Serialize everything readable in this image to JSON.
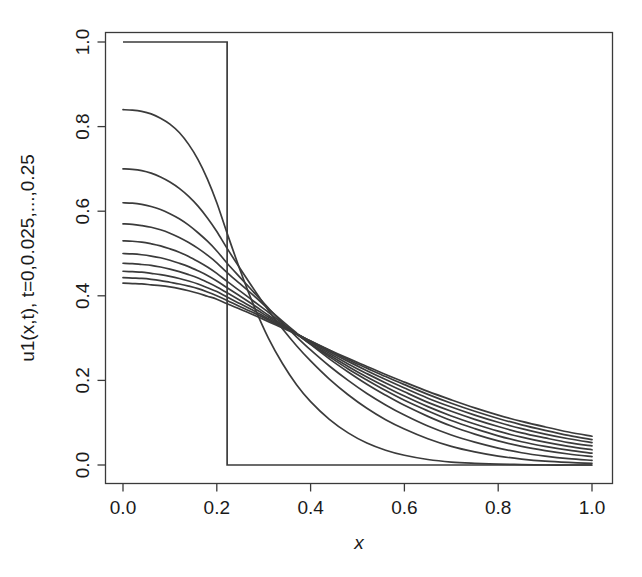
{
  "chart_data": {
    "type": "line",
    "title": "",
    "xlabel": "x",
    "ylabel": "u1(x,t), t=0,0.025,...,0.25",
    "xlim": [
      0.0,
      1.0
    ],
    "ylim": [
      0.0,
      1.0
    ],
    "grid": false,
    "legend": null,
    "x_ticks": [
      0.0,
      0.2,
      0.4,
      0.6,
      0.8,
      1.0
    ],
    "x_tick_labels": [
      "0.0",
      "0.2",
      "0.4",
      "0.6",
      "0.8",
      "1.0"
    ],
    "y_ticks": [
      0.0,
      0.2,
      0.4,
      0.6,
      0.8,
      1.0
    ],
    "y_tick_labels": [
      "0.0",
      "0.2",
      "0.4",
      "0.6",
      "0.8",
      "1.0"
    ],
    "step_location": 0.222,
    "x": [
      0.0,
      0.02,
      0.04,
      0.06,
      0.08,
      0.1,
      0.12,
      0.14,
      0.16,
      0.18,
      0.2,
      0.222,
      0.25,
      0.28,
      0.31,
      0.34,
      0.37,
      0.4,
      0.44,
      0.48,
      0.52,
      0.56,
      0.6,
      0.65,
      0.7,
      0.75,
      0.8,
      0.85,
      0.9,
      0.95,
      1.0
    ],
    "series": [
      {
        "name": "t=0",
        "t": 0,
        "values": [
          1.0,
          1.0,
          1.0,
          1.0,
          1.0,
          1.0,
          1.0,
          1.0,
          1.0,
          1.0,
          1.0,
          1.0,
          0.0,
          0.0,
          0.0,
          0.0,
          0.0,
          0.0,
          0.0,
          0.0,
          0.0,
          0.0,
          0.0,
          0.0,
          0.0,
          0.0,
          0.0,
          0.0,
          0.0,
          0.0,
          0.0
        ]
      },
      {
        "name": "t=0.025",
        "t": 0.025,
        "values": [
          0.84,
          0.839,
          0.836,
          0.83,
          0.82,
          0.806,
          0.786,
          0.758,
          0.722,
          0.676,
          0.62,
          0.548,
          0.46,
          0.374,
          0.3,
          0.24,
          0.19,
          0.15,
          0.108,
          0.076,
          0.052,
          0.035,
          0.023,
          0.013,
          0.007,
          0.004,
          0.002,
          0.001,
          0.0,
          0.0,
          0.0
        ]
      },
      {
        "name": "t=0.05",
        "t": 0.05,
        "values": [
          0.7,
          0.699,
          0.696,
          0.69,
          0.681,
          0.669,
          0.654,
          0.635,
          0.612,
          0.584,
          0.552,
          0.512,
          0.464,
          0.414,
          0.366,
          0.322,
          0.282,
          0.246,
          0.203,
          0.166,
          0.134,
          0.107,
          0.085,
          0.062,
          0.044,
          0.031,
          0.021,
          0.014,
          0.009,
          0.006,
          0.004
        ]
      },
      {
        "name": "t=0.075",
        "t": 0.075,
        "values": [
          0.62,
          0.619,
          0.616,
          0.611,
          0.604,
          0.594,
          0.582,
          0.567,
          0.549,
          0.529,
          0.506,
          0.477,
          0.443,
          0.407,
          0.371,
          0.336,
          0.303,
          0.272,
          0.234,
          0.2,
          0.169,
          0.142,
          0.118,
          0.092,
          0.071,
          0.054,
          0.04,
          0.029,
          0.021,
          0.015,
          0.011
        ]
      },
      {
        "name": "t=0.1",
        "t": 0.1,
        "values": [
          0.57,
          0.569,
          0.566,
          0.562,
          0.556,
          0.548,
          0.538,
          0.526,
          0.512,
          0.496,
          0.478,
          0.455,
          0.428,
          0.399,
          0.369,
          0.34,
          0.312,
          0.285,
          0.251,
          0.22,
          0.191,
          0.165,
          0.141,
          0.115,
          0.092,
          0.073,
          0.057,
          0.044,
          0.034,
          0.026,
          0.02
        ]
      },
      {
        "name": "t=0.125",
        "t": 0.125,
        "values": [
          0.53,
          0.529,
          0.527,
          0.523,
          0.518,
          0.511,
          0.503,
          0.493,
          0.481,
          0.468,
          0.453,
          0.434,
          0.411,
          0.386,
          0.361,
          0.335,
          0.31,
          0.286,
          0.256,
          0.227,
          0.201,
          0.176,
          0.153,
          0.128,
          0.105,
          0.086,
          0.069,
          0.055,
          0.044,
          0.035,
          0.028
        ]
      },
      {
        "name": "t=0.15",
        "t": 0.15,
        "values": [
          0.5,
          0.499,
          0.497,
          0.494,
          0.49,
          0.484,
          0.477,
          0.469,
          0.459,
          0.448,
          0.435,
          0.419,
          0.399,
          0.377,
          0.354,
          0.332,
          0.309,
          0.287,
          0.26,
          0.233,
          0.208,
          0.185,
          0.163,
          0.138,
          0.116,
          0.097,
          0.08,
          0.066,
          0.054,
          0.044,
          0.036
        ]
      },
      {
        "name": "t=0.175",
        "t": 0.175,
        "values": [
          0.477,
          0.476,
          0.474,
          0.472,
          0.468,
          0.463,
          0.457,
          0.45,
          0.442,
          0.432,
          0.421,
          0.407,
          0.389,
          0.37,
          0.35,
          0.33,
          0.31,
          0.29,
          0.264,
          0.239,
          0.216,
          0.194,
          0.173,
          0.148,
          0.127,
          0.108,
          0.091,
          0.076,
          0.064,
          0.053,
          0.045
        ]
      },
      {
        "name": "t=0.2",
        "t": 0.2,
        "values": [
          0.458,
          0.457,
          0.456,
          0.453,
          0.45,
          0.446,
          0.441,
          0.435,
          0.428,
          0.419,
          0.41,
          0.397,
          0.381,
          0.364,
          0.346,
          0.328,
          0.31,
          0.292,
          0.268,
          0.245,
          0.223,
          0.202,
          0.182,
          0.158,
          0.137,
          0.118,
          0.101,
          0.086,
          0.073,
          0.062,
          0.053
        ]
      },
      {
        "name": "t=0.225",
        "t": 0.225,
        "values": [
          0.443,
          0.442,
          0.441,
          0.439,
          0.436,
          0.432,
          0.428,
          0.423,
          0.417,
          0.409,
          0.4,
          0.389,
          0.374,
          0.359,
          0.343,
          0.326,
          0.31,
          0.293,
          0.271,
          0.249,
          0.229,
          0.209,
          0.19,
          0.167,
          0.146,
          0.127,
          0.11,
          0.095,
          0.082,
          0.07,
          0.06
        ]
      },
      {
        "name": "t=0.25",
        "t": 0.25,
        "values": [
          0.43,
          0.429,
          0.428,
          0.426,
          0.424,
          0.421,
          0.417,
          0.412,
          0.406,
          0.399,
          0.392,
          0.381,
          0.368,
          0.354,
          0.339,
          0.324,
          0.309,
          0.293,
          0.272,
          0.252,
          0.233,
          0.214,
          0.196,
          0.174,
          0.154,
          0.135,
          0.118,
          0.103,
          0.09,
          0.078,
          0.068
        ]
      }
    ]
  },
  "style": {
    "line_color": "#3b3b3b",
    "axis_color": "#3a3a3a",
    "background": "#ffffff"
  }
}
